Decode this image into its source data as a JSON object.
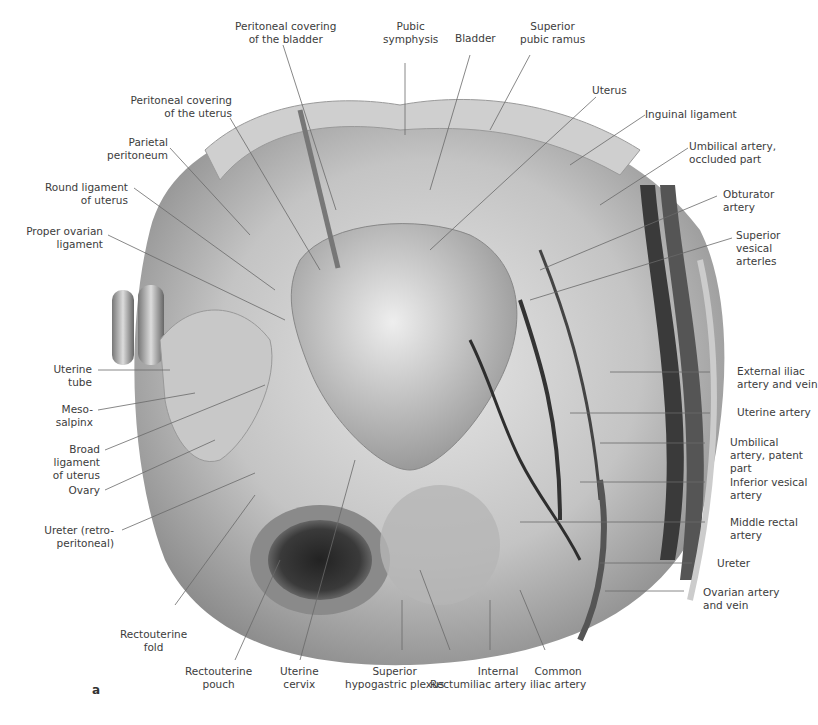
{
  "figure": {
    "panel_letter": "a",
    "labels_top": [
      {
        "id": "peritoneal-covering-bladder",
        "text": [
          "Peritoneal covering",
          "of the bladder"
        ]
      },
      {
        "id": "pubic-symphysis",
        "text": [
          "Pubic",
          "symphysis"
        ]
      },
      {
        "id": "bladder",
        "text": [
          "Bladder"
        ]
      },
      {
        "id": "superior-pubic-ramus",
        "text": [
          "Superior",
          "pubic ramus"
        ]
      },
      {
        "id": "uterus",
        "text": [
          "Uterus"
        ]
      }
    ],
    "labels_left": [
      {
        "id": "peritoneal-covering-uterus",
        "text": [
          "Peritoneal covering",
          "of the uterus"
        ]
      },
      {
        "id": "parietal-peritoneum",
        "text": [
          "Parietal",
          "peritoneum"
        ]
      },
      {
        "id": "round-ligament-uterus",
        "text": [
          "Round ligament",
          "of uterus"
        ]
      },
      {
        "id": "proper-ovarian-ligament",
        "text": [
          "Proper ovarian",
          "ligament"
        ]
      },
      {
        "id": "uterine-tube",
        "text": [
          "Uterine",
          "tube"
        ]
      },
      {
        "id": "mesosalpinx",
        "text": [
          "Meso-",
          "salpinx"
        ]
      },
      {
        "id": "broad-ligament",
        "text": [
          "Broad",
          "ligament",
          "of uterus"
        ]
      },
      {
        "id": "ovary",
        "text": [
          "Ovary"
        ]
      },
      {
        "id": "ureter-retroperitoneal",
        "text": [
          "Ureter (retro-",
          "peritoneal)"
        ]
      },
      {
        "id": "rectouterine-fold",
        "text": [
          "Rectouterine",
          "fold"
        ]
      }
    ],
    "labels_right": [
      {
        "id": "inguinal-ligament",
        "text": [
          "Inguinal ligament"
        ]
      },
      {
        "id": "umbilical-artery-occluded",
        "text": [
          "Umbilical artery,",
          "occluded part"
        ]
      },
      {
        "id": "obturator-artery",
        "text": [
          "Obturator",
          "artery"
        ]
      },
      {
        "id": "superior-vesical-arteries",
        "text": [
          "Superior",
          "vesical",
          "arterles"
        ]
      },
      {
        "id": "external-iliac",
        "text": [
          "External iliac",
          "artery and vein"
        ]
      },
      {
        "id": "uterine-artery",
        "text": [
          "Uterine artery"
        ]
      },
      {
        "id": "umbilical-artery-patent",
        "text": [
          "Umbilical",
          "artery, patent",
          "part"
        ]
      },
      {
        "id": "inferior-vesical-artery",
        "text": [
          "Inferior vesical",
          "artery"
        ]
      },
      {
        "id": "middle-rectal-artery",
        "text": [
          "Middle rectal",
          "artery"
        ]
      },
      {
        "id": "ureter",
        "text": [
          "Ureter"
        ]
      },
      {
        "id": "ovarian-artery-vein",
        "text": [
          "Ovarian artery",
          "and vein"
        ]
      }
    ],
    "labels_bottom": [
      {
        "id": "rectouterine-pouch",
        "text": [
          "Rectouterine",
          "pouch"
        ]
      },
      {
        "id": "uterine-cervix",
        "text": [
          "Uterine",
          "cervix"
        ]
      },
      {
        "id": "superior-hypogastric-plexus",
        "text": [
          "Superior",
          "hypogastric plexus"
        ]
      },
      {
        "id": "rectum",
        "text": [
          "Rectum"
        ]
      },
      {
        "id": "internal-iliac-artery",
        "text": [
          "Internal",
          "iliac artery"
        ]
      },
      {
        "id": "common-iliac-artery",
        "text": [
          "Common",
          "iliac artery"
        ]
      }
    ],
    "colors": {
      "tissue_light": "#d9d9d9",
      "tissue_mid": "#a8a8a8",
      "tissue_dark": "#555555",
      "vessel": "#3a3a3a",
      "leader": "#6a6a6a",
      "text": "#3c3c3c"
    }
  }
}
